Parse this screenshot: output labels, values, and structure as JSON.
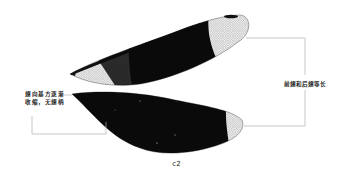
{
  "figure": {
    "caption": "c2",
    "annotations": {
      "left": "翅向基方逐渐收缩，无翅柄",
      "right": "前翅和后翅等长"
    },
    "wings": [
      {
        "name": "forewing",
        "pattern": "clear base, dark middle band, clear tip with dark pterostigma"
      },
      {
        "name": "hindwing",
        "pattern": "mostly dark with clear tip"
      }
    ],
    "colors": {
      "wing_dark": "#0a0a0a",
      "wing_venation": "#888888",
      "leader_line": "#b0b0b0",
      "text": "#222222"
    }
  }
}
